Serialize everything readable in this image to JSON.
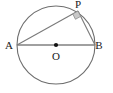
{
  "figure": {
    "kind": "circle-geometry-diagram",
    "width": 113,
    "height": 93,
    "background_color": "#ffffff",
    "stroke_color": "#6e6e6e",
    "chord_color": "#7a7a7a",
    "diameter_color": "#808080",
    "point_color": "#111111",
    "right_angle_fill": "#c9c9c9",
    "right_angle_stroke": "#8a8a8a",
    "label_color": "#1a1a1a"
  },
  "circle": {
    "center_x": 56,
    "center_y": 45,
    "radius": 39
  },
  "points": {
    "A": {
      "label": "A",
      "x": 17,
      "y": 45,
      "label_x": 9,
      "label_y": 45
    },
    "B": {
      "label": "B",
      "x": 95,
      "y": 45,
      "label_x": 99,
      "label_y": 45
    },
    "P": {
      "label": "P",
      "x": 78,
      "y": 11,
      "label_x": 78,
      "label_y": 4
    },
    "O": {
      "label": "O",
      "x": 56,
      "y": 45,
      "label_x": 56,
      "label_y": 56
    }
  },
  "segments": [
    {
      "name": "diameter-AB",
      "from": "A",
      "to": "B"
    },
    {
      "name": "chord-AP",
      "from": "A",
      "to": "P"
    },
    {
      "name": "chord-PB",
      "from": "P",
      "to": "B"
    }
  ],
  "marks": {
    "right_angle_at": "P",
    "center_dot_at": "O"
  }
}
